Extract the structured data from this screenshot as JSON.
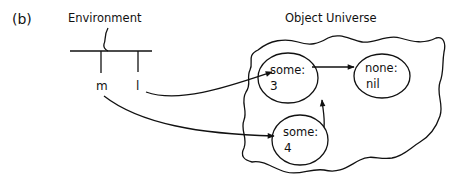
{
  "panel_label": "(b)",
  "environment": {
    "title": "Environment",
    "bindings": [
      {
        "name": "m"
      },
      {
        "name": "l"
      }
    ]
  },
  "object_universe": {
    "title": "Object Universe",
    "objects": [
      {
        "id": "obj1",
        "tag": "some:",
        "value": "3"
      },
      {
        "id": "obj2",
        "tag": "none:",
        "value": "nil"
      },
      {
        "id": "obj3",
        "tag": "some:",
        "value": "4"
      }
    ]
  },
  "edges": [
    {
      "from": "l",
      "to": "obj1"
    },
    {
      "from": "m",
      "to": "obj3"
    },
    {
      "from": "obj1",
      "to": "obj2"
    },
    {
      "from": "obj3",
      "to": "obj1"
    }
  ]
}
